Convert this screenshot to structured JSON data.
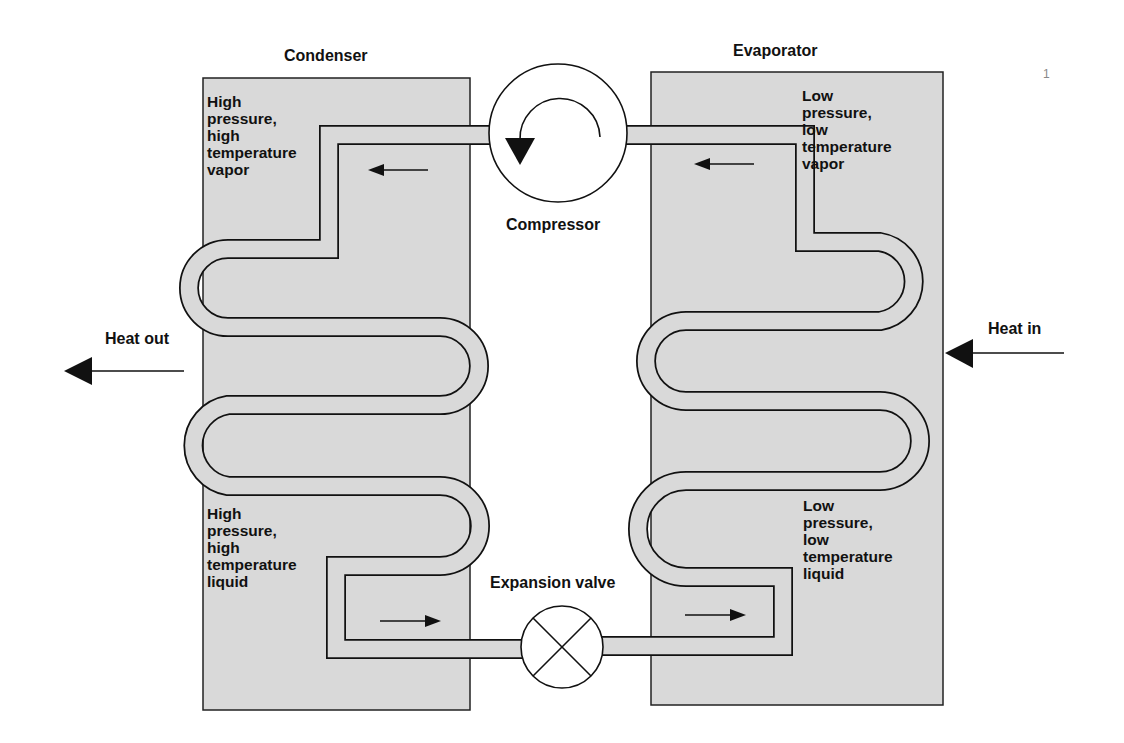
{
  "page_number": "1",
  "diagram": {
    "colors": {
      "panel_fill": "#d9d9d9",
      "line": "#111111",
      "background": "#ffffff"
    },
    "components": {
      "condenser": {
        "label": "Condenser"
      },
      "evaporator": {
        "label": "Evaporator"
      },
      "compressor": {
        "label": "Compressor",
        "icon": "rotation-arrow-icon"
      },
      "expansion_valve": {
        "label": "Expansion valve",
        "icon": "cross-circle-icon"
      }
    },
    "states": {
      "condenser_top": "High\npressure,\nhigh\ntemperature\nvapor",
      "condenser_bottom": "High\npressure,\nhigh\ntemperature\nliquid",
      "evaporator_top": "Low\npressure,\nlow\ntemperature\nvapor",
      "evaporator_bottom": "Low\npressure,\nlow\ntemperature\nliquid"
    },
    "heat_flows": {
      "left": {
        "label": "Heat out",
        "direction": "left"
      },
      "right": {
        "label": "Heat in",
        "direction": "left"
      }
    },
    "flow_arrows": [
      {
        "location": "condenser-top",
        "direction": "left"
      },
      {
        "location": "evaporator-top",
        "direction": "left"
      },
      {
        "location": "condenser-bottom",
        "direction": "right"
      },
      {
        "location": "evaporator-bottom",
        "direction": "right"
      }
    ]
  }
}
